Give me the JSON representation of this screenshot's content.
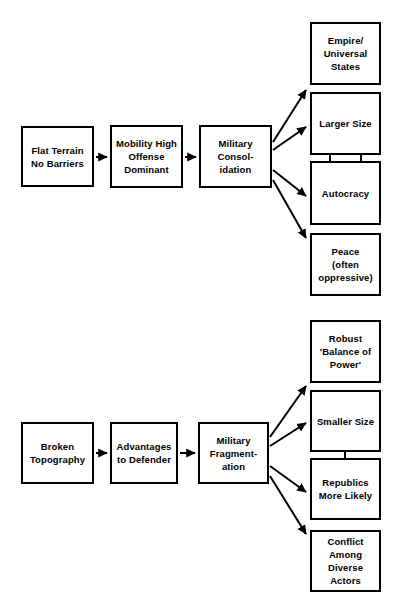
{
  "diagram": {
    "stroke_color": "#000000",
    "background_color": "#ffffff",
    "text_color": "#000000",
    "groups": [
      {
        "id": "flat-terrain-chain",
        "name": "Flat Terrain Consolidation Chain",
        "nodes": [
          {
            "id": "flat-terrain",
            "label": "Flat Terrain\nNo Barriers",
            "x": 21,
            "y": 126,
            "w": 73,
            "h": 61
          },
          {
            "id": "mobility-high",
            "label": "Mobility High\nOffense\nDominant",
            "x": 110,
            "y": 125,
            "w": 73,
            "h": 63
          },
          {
            "id": "military-consolidation",
            "label": "Military\nConsol-\nidation",
            "x": 199,
            "y": 125,
            "w": 73,
            "h": 63
          },
          {
            "id": "empire-universal-states",
            "label": "Empire/\nUniversal\nStates",
            "x": 310,
            "y": 22,
            "w": 71,
            "h": 63
          },
          {
            "id": "larger-size",
            "label": "Larger Size",
            "x": 310,
            "y": 92,
            "w": 71,
            "h": 63
          },
          {
            "id": "autocracy",
            "label": "Autocracy",
            "x": 310,
            "y": 161,
            "w": 71,
            "h": 64
          },
          {
            "id": "peace-oppressive",
            "label": "Peace\n(often\noppressive)",
            "x": 310,
            "y": 233,
            "w": 71,
            "h": 63
          }
        ]
      },
      {
        "id": "broken-topography-chain",
        "name": "Broken Topography Fragmentation Chain",
        "nodes": [
          {
            "id": "broken-topography",
            "label": "Broken\nTopography",
            "x": 21,
            "y": 422,
            "w": 73,
            "h": 62
          },
          {
            "id": "advantages-defender",
            "label": "Advantages\nto Defender",
            "x": 110,
            "y": 422,
            "w": 68,
            "h": 62
          },
          {
            "id": "military-fragmentation",
            "label": "Military\nFragment-\nation",
            "x": 198,
            "y": 422,
            "w": 71,
            "h": 62
          },
          {
            "id": "robust-balance-of-power",
            "label": "Robust\n'Balance of\nPower'",
            "x": 310,
            "y": 320,
            "w": 71,
            "h": 63
          },
          {
            "id": "smaller-size",
            "label": "Smaller Size",
            "x": 310,
            "y": 390,
            "w": 71,
            "h": 62
          },
          {
            "id": "republics-more-likely",
            "label": "Republics\nMore Likely",
            "x": 310,
            "y": 458,
            "w": 71,
            "h": 62
          },
          {
            "id": "conflict-diverse-actors",
            "label": "Conflict\nAmong\nDiverse\nActors",
            "x": 310,
            "y": 530,
            "w": 71,
            "h": 62
          }
        ]
      }
    ],
    "connectors": [
      {
        "id": "c1",
        "from": "flat-terrain",
        "to": "mobility-high",
        "kind": "horizontal-arrow",
        "path": "M 96 157 L 107 157"
      },
      {
        "id": "c2",
        "from": "mobility-high",
        "to": "military-consolidation",
        "kind": "horizontal-arrow",
        "path": "M 185 157 L 196 157"
      },
      {
        "id": "c3",
        "from": "military-consolidation",
        "to": "empire-universal-states",
        "kind": "diagonal-arrow",
        "path": "M 273 142 L 306 90"
      },
      {
        "id": "c4",
        "from": "military-consolidation",
        "to": "larger-size",
        "kind": "diagonal-arrow",
        "path": "M 273 150 L 306 127"
      },
      {
        "id": "c5",
        "from": "military-consolidation",
        "to": "autocracy",
        "kind": "diagonal-arrow",
        "path": "M 273 170 L 306 196"
      },
      {
        "id": "c6",
        "from": "military-consolidation",
        "to": "peace-oppressive",
        "kind": "diagonal-arrow",
        "path": "M 273 180 L 306 238"
      },
      {
        "id": "c7",
        "from": "larger-size",
        "to": "autocracy",
        "kind": "vertical-arrow-down",
        "path": "M 330 154 L 330 175"
      },
      {
        "id": "c8",
        "from": "autocracy",
        "to": "larger-size",
        "kind": "vertical-arrow-up",
        "path": "M 361 178 L 361 145"
      },
      {
        "id": "c9",
        "from": "broken-topography",
        "to": "advantages-defender",
        "kind": "horizontal-arrow",
        "path": "M 96 453 L 107 453"
      },
      {
        "id": "c10",
        "from": "advantages-defender",
        "to": "military-fragmentation",
        "kind": "horizontal-arrow",
        "path": "M 180 453 L 195 453"
      },
      {
        "id": "c11",
        "from": "military-fragmentation",
        "to": "robust-balance-of-power",
        "kind": "diagonal-arrow",
        "path": "M 270 437 L 306 386"
      },
      {
        "id": "c12",
        "from": "military-fragmentation",
        "to": "smaller-size",
        "kind": "diagonal-arrow",
        "path": "M 270 446 L 306 423"
      },
      {
        "id": "c13",
        "from": "military-fragmentation",
        "to": "republics-more-likely",
        "kind": "diagonal-arrow",
        "path": "M 270 466 L 306 492"
      },
      {
        "id": "c14",
        "from": "military-fragmentation",
        "to": "conflict-diverse-actors",
        "kind": "diagonal-arrow",
        "path": "M 270 476 L 306 534"
      },
      {
        "id": "c15",
        "from": "smaller-size",
        "to": "republics-more-likely",
        "kind": "vertical-arrow-down",
        "path": "M 345 451 L 345 472"
      }
    ]
  }
}
